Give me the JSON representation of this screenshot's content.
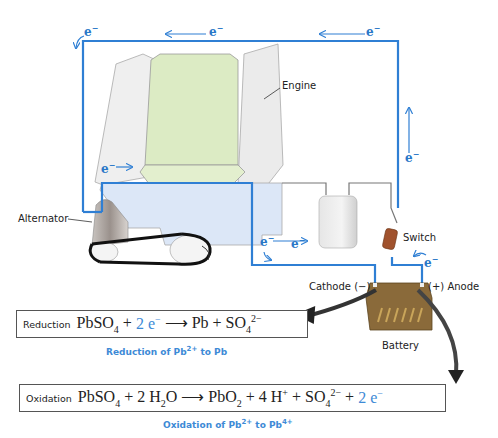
{
  "labels": {
    "engine": "Engine",
    "alternator": "Alternator",
    "switch": "Switch",
    "cathode": "Cathode",
    "cathode_sign": "(−)",
    "anode": "Anode",
    "anode_sign": "(+)",
    "battery": "Battery"
  },
  "electron": {
    "symbol": "e",
    "charge": "−"
  },
  "reduction": {
    "tag": "Reduction",
    "reactant": "PbSO",
    "reactant_sub": "4",
    "plus1": " + ",
    "electrons": "2 e",
    "electrons_sup": "−",
    "arrow": " ⟶ ",
    "product1": "Pb",
    "plus2": " + ",
    "product2": "SO",
    "product2_sub": "4",
    "product2_sup": "2−",
    "caption_pre": "Reduction of Pb",
    "caption_sup": "2+",
    "caption_post": " to Pb"
  },
  "oxidation": {
    "tag": "Oxidation",
    "reactant1": "PbSO",
    "reactant1_sub": "4",
    "plus1": " + 2 H",
    "water_sub": "2",
    "water_o": "O",
    "arrow": " ⟶ ",
    "product1": "PbO",
    "product1_sub": "2",
    "plus2": " + 4 H",
    "h_sup": "+",
    "plus3": " + SO",
    "so4_sub": "4",
    "so4_sup": "2−",
    "plus4": " + ",
    "electrons": "2 e",
    "electrons_sup": "−",
    "caption_pre": "Oxidation of Pb",
    "caption_sup1": "2+",
    "caption_mid": " to Pb",
    "caption_sup2": "4+"
  },
  "colors": {
    "wire_blue": "#2f7fd4",
    "wire_gray": "#777777",
    "engine_green": "#dcebc4",
    "engine_gray": "#ececec",
    "block_blue": "#dce7f7",
    "battery_brown": "#8a6a3a",
    "arrow_dark": "#333333"
  }
}
